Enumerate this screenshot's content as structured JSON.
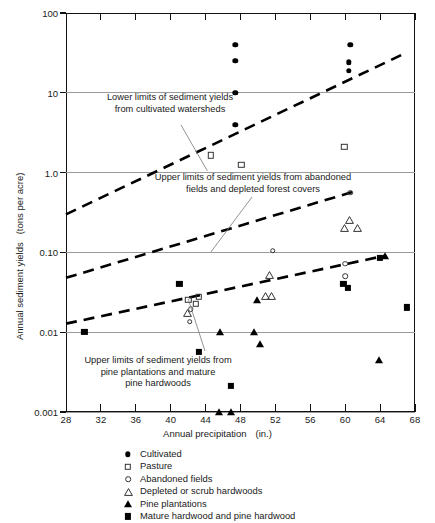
{
  "chart_data": {
    "type": "scatter",
    "title": "",
    "xlabel": "Annual precipitation",
    "xunits": "(in.)",
    "ylabel": "Annual sediment yields",
    "yunits": "(tons per acre)",
    "xlim": [
      28,
      68
    ],
    "ylim": [
      0.001,
      100
    ],
    "yscale": "log",
    "xscale": "linear",
    "grid": true,
    "legend_position": "below",
    "xticks": [
      28,
      32,
      36,
      40,
      44,
      48,
      52,
      56,
      60,
      64,
      68
    ],
    "xticklabels": [
      "28",
      "32",
      "36",
      "40",
      "44",
      "48",
      "52",
      "56",
      "60",
      "64",
      "68"
    ],
    "yticks": [
      100,
      10,
      1.0,
      0.1,
      0.01,
      0.001
    ],
    "yticklabels": [
      "100",
      "10",
      "1.0",
      "0.10",
      "0.01",
      "0.001"
    ],
    "series": [
      {
        "name": "Cultivated",
        "marker": "filled-circle",
        "points": [
          [
            47.4,
            40
          ],
          [
            47.4,
            25
          ],
          [
            47.4,
            10
          ],
          [
            47.4,
            4.0
          ],
          [
            60.6,
            40
          ],
          [
            60.4,
            24
          ],
          [
            60.4,
            19
          ]
        ]
      },
      {
        "name": "Pasture",
        "marker": "open-square",
        "points": [
          [
            44.6,
            1.65
          ],
          [
            48.1,
            1.25
          ],
          [
            59.9,
            2.1
          ],
          [
            42.0,
            0.0255
          ],
          [
            42.9,
            0.0225
          ],
          [
            43.2,
            0.028
          ]
        ]
      },
      {
        "name": "Abandoned fields",
        "marker": "open-circle",
        "points": [
          [
            60.6,
            0.56
          ],
          [
            51.7,
            0.105
          ],
          [
            60.0,
            0.072
          ],
          [
            60.0,
            0.05
          ],
          [
            42.3,
            0.0195
          ],
          [
            42.2,
            0.0135
          ]
        ]
      },
      {
        "name": "Depleted or scrub hardwoods",
        "marker": "open-triangle",
        "points": [
          [
            60.5,
            0.255
          ],
          [
            59.9,
            0.205
          ],
          [
            61.4,
            0.2
          ],
          [
            51.3,
            0.052
          ],
          [
            50.9,
            0.0285
          ],
          [
            51.6,
            0.0285
          ],
          [
            41.9,
            0.0175
          ]
        ]
      },
      {
        "name": "Pine plantations",
        "marker": "filled-triangle",
        "points": [
          [
            45.7,
            0.0102
          ],
          [
            49.6,
            0.0102
          ],
          [
            49.9,
            0.0255
          ],
          [
            50.2,
            0.0072
          ],
          [
            63.9,
            0.0045
          ],
          [
            64.6,
            0.091
          ],
          [
            45.5,
            0.001
          ],
          [
            46.9,
            0.001
          ]
        ]
      },
      {
        "name": "Mature hardwood and pine hardwood",
        "marker": "filled-square",
        "points": [
          [
            30.1,
            0.0102
          ],
          [
            41.0,
            0.04
          ],
          [
            43.2,
            0.0057
          ],
          [
            46.9,
            0.0021
          ],
          [
            59.8,
            0.0405
          ],
          [
            60.3,
            0.0355
          ],
          [
            64.0,
            0.086
          ],
          [
            67.1,
            0.0205
          ]
        ]
      }
    ],
    "trend_lines": [
      {
        "name": "Lower limits of sediment yields from cultivated watersheds",
        "style": "dashed",
        "from": [
          28.0,
          0.3
        ],
        "to": [
          66.5,
          30.0
        ]
      },
      {
        "name": "Upper limits of sediment yields from abandoned fields and depleted forest covers",
        "style": "dashed",
        "from": [
          28.0,
          0.048
        ],
        "to": [
          60.8,
          0.57
        ]
      },
      {
        "name": "Upper limits of sediment yields from pine plantations and mature pine hardwoods",
        "style": "dashed",
        "from": [
          28.0,
          0.0128
        ],
        "to": [
          64.6,
          0.091
        ]
      }
    ],
    "annotations": [
      {
        "id": "anno-cultivated",
        "lines": [
          "Lower limits of sediment yields",
          "from cultivated watersheds"
        ],
        "leader_to": [
          44.2,
          1.05
        ]
      },
      {
        "id": "anno-abandoned",
        "lines": [
          "Upper limits of sediment yields from abandoned",
          "fields and depleted forest covers"
        ],
        "leader_to": [
          44.6,
          0.101
        ]
      },
      {
        "id": "anno-pine",
        "lines": [
          "Upper limits of sediment yields from",
          "pine plantations and mature",
          "pine hardwoods"
        ],
        "leader_to": [
          42.0,
          0.0262
        ]
      }
    ]
  },
  "legend": {
    "items": [
      {
        "label": "Cultivated",
        "marker": "filled-circle"
      },
      {
        "label": "Pasture",
        "marker": "open-square"
      },
      {
        "label": "Abandoned fields",
        "marker": "open-circle"
      },
      {
        "label": "Depleted or scrub hardwoods",
        "marker": "open-triangle"
      },
      {
        "label": "Pine plantations",
        "marker": "filled-triangle"
      },
      {
        "label": "Mature hardwood and pine hardwood",
        "marker": "filled-square"
      }
    ]
  }
}
